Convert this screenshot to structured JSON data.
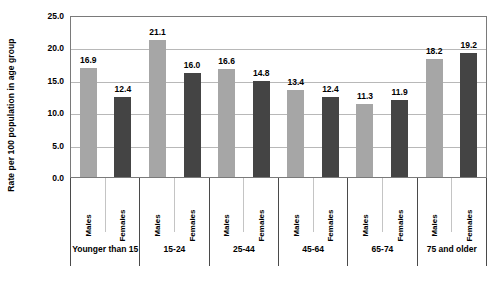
{
  "chart_data": {
    "type": "bar",
    "title": "",
    "xlabel": "",
    "ylabel": "Rate per 100 population in age group",
    "ylim": [
      0,
      25
    ],
    "ytick_step": 5,
    "grid": true,
    "legend": "none",
    "categories": [
      "Younger than 15",
      "15-24",
      "25-44",
      "45-64",
      "65-74",
      "75 and older"
    ],
    "series": [
      {
        "name": "Males",
        "values": [
          16.9,
          21.1,
          16.6,
          13.4,
          11.3,
          18.2
        ]
      },
      {
        "name": "Females",
        "values": [
          12.4,
          16.0,
          14.8,
          12.4,
          11.9,
          19.2
        ]
      }
    ],
    "ytick_labels": [
      "25.0",
      "20.0",
      "15.0",
      "10.0",
      "5.0",
      "0.0"
    ],
    "ytick_values": [
      25,
      20,
      15,
      10,
      5,
      0
    ],
    "colors": {
      "males_bar": "#a6a6a6",
      "females_bar": "#444444",
      "gridline": "#b8b8b8",
      "axis_border": "#7a7a7a",
      "table_border": "#4a4a4a",
      "text": "#000000",
      "background": "#ffffff"
    },
    "bars": [
      {
        "group": "Younger than 15",
        "sex": "Males",
        "value": 16.9,
        "label": "16.9"
      },
      {
        "group": "Younger than 15",
        "sex": "Females",
        "value": 12.4,
        "label": "12.4"
      },
      {
        "group": "15-24",
        "sex": "Males",
        "value": 21.1,
        "label": "21.1"
      },
      {
        "group": "15-24",
        "sex": "Females",
        "value": 16.0,
        "label": "16.0"
      },
      {
        "group": "25-44",
        "sex": "Males",
        "value": 16.6,
        "label": "16.6"
      },
      {
        "group": "25-44",
        "sex": "Females",
        "value": 14.8,
        "label": "14.8"
      },
      {
        "group": "45-64",
        "sex": "Males",
        "value": 13.4,
        "label": "13.4"
      },
      {
        "group": "45-64",
        "sex": "Females",
        "value": 12.4,
        "label": "12.4"
      },
      {
        "group": "65-74",
        "sex": "Males",
        "value": 11.3,
        "label": "11.3"
      },
      {
        "group": "65-74",
        "sex": "Females",
        "value": 11.9,
        "label": "11.9"
      },
      {
        "group": "75 and older",
        "sex": "Males",
        "value": 18.2,
        "label": "18.2"
      },
      {
        "group": "75 and older",
        "sex": "Females",
        "value": 19.2,
        "label": "19.2"
      }
    ],
    "sex_labels": [
      "Males",
      "Females",
      "Males",
      "Females",
      "Males",
      "Females",
      "Males",
      "Females",
      "Males",
      "Females",
      "Males",
      "Females"
    ]
  }
}
